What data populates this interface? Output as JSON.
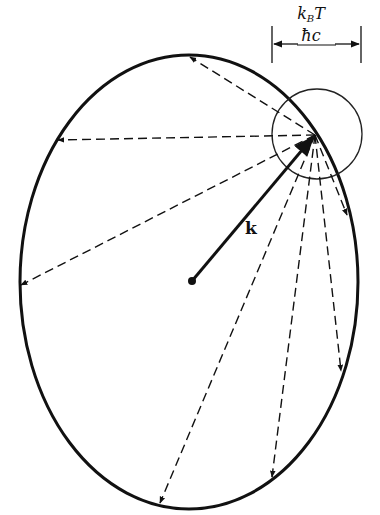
{
  "diagram": {
    "labels": {
      "wavevector": "k",
      "scale_numerator_k": "k",
      "scale_numerator_sub": "B",
      "scale_numerator_T": "T",
      "scale_denominator": "ħc"
    },
    "shapes": {
      "ellipse": {
        "cx": 189,
        "cy": 282,
        "rx": 169,
        "ry": 227
      },
      "small_circle": {
        "cx": 317,
        "cy": 134,
        "r": 45
      },
      "focus_point": {
        "x": 315,
        "y": 135
      },
      "center_dot": {
        "x": 192,
        "y": 281
      }
    },
    "scattered_vectors": [
      {
        "to": [
          190,
          57
        ]
      },
      {
        "to": [
          58,
          140
        ]
      },
      {
        "to": [
          21,
          285
        ]
      },
      {
        "to": [
          160,
          503
        ]
      },
      {
        "to": [
          272,
          477
        ]
      },
      {
        "to": [
          341,
          371
        ]
      },
      {
        "to": [
          347,
          215
        ]
      }
    ],
    "colors": {
      "stroke": "#111111",
      "background": "#ffffff"
    }
  }
}
